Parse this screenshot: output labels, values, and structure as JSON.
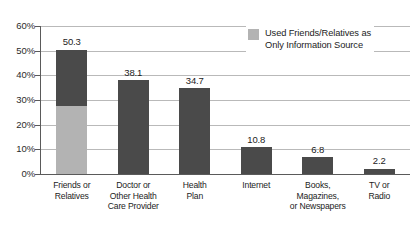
{
  "chart_data": {
    "type": "bar",
    "title": "",
    "subtitle": "",
    "xlabel": "",
    "ylabel": "",
    "ylim": [
      0,
      60
    ],
    "y_ticks": [
      "0%",
      "10%",
      "20%",
      "30%",
      "40%",
      "50%",
      "60%"
    ],
    "y_tick_values": [
      0,
      10,
      20,
      30,
      40,
      50,
      60
    ],
    "grid": true,
    "legend_position": "top-right",
    "categories": [
      "Friends or\nRelatives",
      "Doctor or\nOther Health\nCare Provider",
      "Health\nPlan",
      "Internet",
      "Books,\nMagazines,\nor Newspapers",
      "TV or\nRadio"
    ],
    "series": [
      {
        "name": "Information Source Used",
        "color": "#4a4a4a",
        "values": [
          50.3,
          38.1,
          34.7,
          10.8,
          6.8,
          2.2
        ],
        "value_labels": [
          "50.3",
          "38.1",
          "34.7",
          "10.8",
          "6.8",
          "2.2"
        ]
      },
      {
        "name": "Used Friends/Relatives as\nOnly Information Source",
        "color": "#b3b3b3",
        "values": [
          27.5,
          null,
          null,
          null,
          null,
          null
        ],
        "value_labels": [
          "",
          "",
          "",
          "",
          "",
          ""
        ]
      }
    ],
    "legend": [
      {
        "label": "Used Friends/Relatives as\nOnly Information Source",
        "color": "#b3b3b3"
      }
    ]
  },
  "colors": {
    "bar_primary": "#4a4a4a",
    "bar_secondary": "#b3b3b3",
    "gridline": "#b9b9b9",
    "axis": "#5a5a5a",
    "text": "#1c1c1c",
    "background": "#ffffff"
  }
}
